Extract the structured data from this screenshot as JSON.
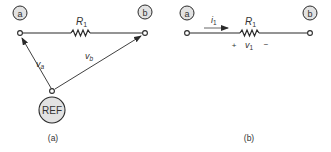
{
  "panels": [
    {
      "caption": "(a)",
      "nodes": [
        {
          "label": "a"
        },
        {
          "label": "b"
        },
        {
          "label": "REF"
        }
      ],
      "resistor": {
        "label": "R",
        "subscript": "1"
      },
      "voltages": [
        {
          "label": "v",
          "subscript": "a"
        },
        {
          "label": "v",
          "subscript": "b"
        }
      ]
    },
    {
      "caption": "(b)",
      "nodes": [
        {
          "label": "a"
        },
        {
          "label": "b"
        }
      ],
      "resistor": {
        "label": "R",
        "subscript": "1"
      },
      "current": {
        "label": "i",
        "subscript": "1"
      },
      "voltage": {
        "label": "v",
        "subscript": "1",
        "plus": "+",
        "minus": "−"
      }
    }
  ],
  "colors": {
    "line": "#2a2a2a",
    "node_fill": "#e2e2e2",
    "text": "#333333"
  }
}
